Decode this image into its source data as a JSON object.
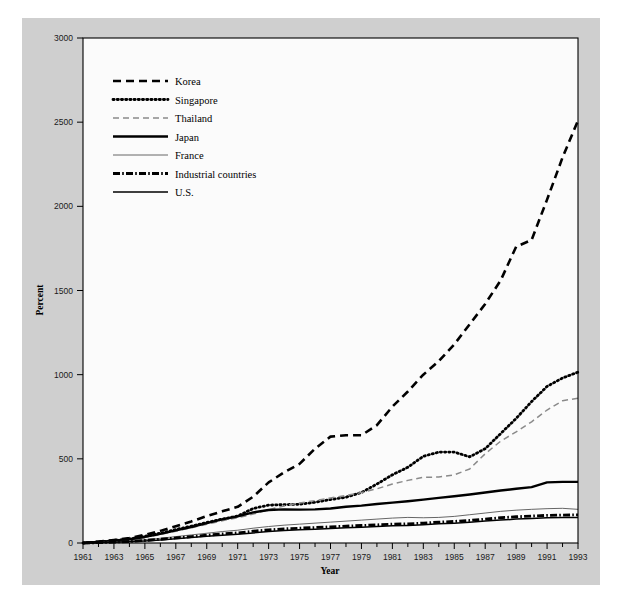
{
  "figure": {
    "background_color": "#ffffff",
    "panel_color": "#cfcfcf",
    "plot_area_color": "#fbfbfb",
    "frame_color": "#000000"
  },
  "axes": {
    "y_title": "Percent",
    "x_title": "Year",
    "y_ticks": [
      "0",
      "500",
      "1000",
      "1500",
      "2000",
      "2500",
      "3000"
    ],
    "x_ticks": [
      "1961",
      "1963",
      "1965",
      "1967",
      "1969",
      "1971",
      "1973",
      "1975",
      "1977",
      "1979",
      "1981",
      "1983",
      "1985",
      "1987",
      "1989",
      "1991",
      "1993"
    ]
  },
  "legend": {
    "items": [
      {
        "label": "Korea",
        "style": "dashed-bold",
        "color": "#000000"
      },
      {
        "label": "Singapore",
        "style": "dotted-bold",
        "color": "#000000"
      },
      {
        "label": "Thailand",
        "style": "dashed-light",
        "color": "#8a8a8a"
      },
      {
        "label": "Japan",
        "style": "solid-bold",
        "color": "#000000"
      },
      {
        "label": "France",
        "style": "solid-thin",
        "color": "#555555"
      },
      {
        "label": "Industrial countries",
        "style": "dash-dot-bold",
        "color": "#000000"
      },
      {
        "label": "U.S.",
        "style": "solid-medium",
        "color": "#000000"
      }
    ]
  },
  "chart_data": {
    "type": "line",
    "title": "",
    "subtitle": "",
    "xlabel": "Year",
    "ylabel": "Percent",
    "xlim": [
      1961,
      1993
    ],
    "ylim": [
      0,
      3000
    ],
    "grid": false,
    "legend_position": "upper-left",
    "x": [
      1961,
      1962,
      1963,
      1964,
      1965,
      1966,
      1967,
      1968,
      1969,
      1970,
      1971,
      1972,
      1973,
      1974,
      1975,
      1976,
      1977,
      1978,
      1979,
      1980,
      1981,
      1982,
      1983,
      1984,
      1985,
      1986,
      1987,
      1988,
      1989,
      1990,
      1991,
      1992,
      1993
    ],
    "series": [
      {
        "name": "Korea",
        "style": "dashed-bold",
        "color": "#000000",
        "values": [
          0,
          8,
          18,
          30,
          48,
          72,
          100,
          128,
          160,
          188,
          215,
          275,
          360,
          420,
          470,
          560,
          632,
          640,
          640,
          700,
          810,
          900,
          1000,
          1080,
          1180,
          1300,
          1420,
          1560,
          1760,
          1800,
          2040,
          2290,
          2510
        ]
      },
      {
        "name": "Singapore",
        "style": "dotted-bold",
        "color": "#000000",
        "values": [
          0,
          6,
          14,
          24,
          40,
          58,
          80,
          100,
          122,
          142,
          160,
          205,
          225,
          228,
          230,
          242,
          258,
          272,
          300,
          350,
          405,
          450,
          515,
          540,
          540,
          512,
          560,
          650,
          740,
          840,
          930,
          980,
          1015
        ]
      },
      {
        "name": "Thailand",
        "style": "dashed-light",
        "color": "#8a8a8a",
        "values": [
          0,
          5,
          12,
          20,
          33,
          50,
          70,
          90,
          112,
          132,
          150,
          172,
          198,
          220,
          238,
          252,
          268,
          282,
          300,
          322,
          350,
          372,
          390,
          392,
          405,
          440,
          530,
          605,
          660,
          720,
          790,
          845,
          860
        ]
      },
      {
        "name": "Japan",
        "style": "solid-bold",
        "color": "#000000",
        "values": [
          0,
          6,
          13,
          22,
          36,
          54,
          75,
          95,
          118,
          140,
          158,
          182,
          196,
          200,
          198,
          200,
          205,
          215,
          222,
          232,
          240,
          248,
          258,
          268,
          278,
          288,
          300,
          312,
          322,
          332,
          360,
          363,
          363
        ]
      },
      {
        "name": "France",
        "style": "solid-thin",
        "color": "#555555",
        "values": [
          0,
          3,
          7,
          12,
          20,
          28,
          38,
          48,
          58,
          68,
          76,
          88,
          98,
          106,
          112,
          118,
          124,
          130,
          136,
          142,
          148,
          152,
          150,
          152,
          158,
          168,
          178,
          188,
          195,
          200,
          204,
          206,
          200
        ]
      },
      {
        "name": "Industrial countries",
        "style": "dash-dot-bold",
        "color": "#000000",
        "values": [
          0,
          2,
          5,
          9,
          15,
          22,
          30,
          38,
          46,
          54,
          60,
          70,
          78,
          84,
          88,
          92,
          96,
          100,
          104,
          108,
          112,
          114,
          118,
          124,
          128,
          134,
          142,
          150,
          156,
          160,
          164,
          166,
          167
        ]
      },
      {
        "name": "U.S.",
        "style": "solid-medium",
        "color": "#000000",
        "values": [
          0,
          2,
          4,
          7,
          12,
          18,
          25,
          32,
          40,
          46,
          52,
          60,
          68,
          74,
          78,
          82,
          86,
          90,
          94,
          98,
          102,
          104,
          108,
          114,
          118,
          124,
          130,
          136,
          142,
          146,
          150,
          152,
          152
        ]
      }
    ]
  }
}
